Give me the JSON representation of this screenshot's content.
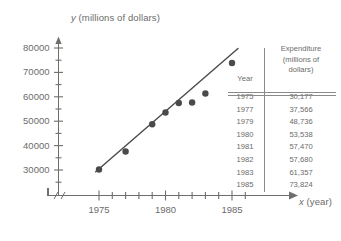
{
  "chart_data": {
    "type": "scatter",
    "title": "",
    "xlabel": "x (year)",
    "ylabel": "y (millions of dollars)",
    "x_axis_variable": "x",
    "x_axis_unit": "(year)",
    "y_axis_variable": "y",
    "y_axis_unit": "(millions of dollars)",
    "x": [
      1975,
      1977,
      1979,
      1980,
      1981,
      1982,
      1983,
      1985
    ],
    "values": [
      30177,
      37566,
      48736,
      53538,
      57470,
      57680,
      61357,
      73824
    ],
    "point_labels": [
      "30,177",
      "37,566",
      "48,736",
      "53,538",
      "57,470",
      "57,680",
      "61,357",
      "73,824"
    ],
    "xlim": [
      1974.2,
      1986.2
    ],
    "ylim": [
      27500,
      82000
    ],
    "x_tick_labels": [
      "1975",
      "1980",
      "1985"
    ],
    "x_major_ticks": [
      1975,
      1980,
      1985
    ],
    "x_minor_tick_step": 1,
    "y_tick_labels": [
      "30000",
      "40000",
      "50000",
      "60000",
      "70000",
      "80000"
    ],
    "y_major_ticks": [
      30000,
      40000,
      50000,
      60000,
      70000,
      80000
    ],
    "y_minor_tick_step": 5000,
    "grid": false,
    "legend": false,
    "has_axis_break": true,
    "axis_break_symbol": "//",
    "trendline": {
      "visible": true,
      "x_start": 1974.75,
      "y_start": 29300,
      "x_end": 1985.45,
      "y_end": 79800
    },
    "marker_color": "#4a4a4a",
    "line_color": "#4a4a4a",
    "axis_color": "#6e6e6e"
  },
  "table": {
    "header_year": "Year",
    "header_expenditure_line1": "Expenditure",
    "header_expenditure_line2": "(millions of",
    "header_expenditure_line3": "dollars)",
    "rows": [
      {
        "year": "1975",
        "expenditure": "30,177"
      },
      {
        "year": "1977",
        "expenditure": "37,566"
      },
      {
        "year": "1979",
        "expenditure": "48,736"
      },
      {
        "year": "1980",
        "expenditure": "53,538"
      },
      {
        "year": "1981",
        "expenditure": "57,470"
      },
      {
        "year": "1982",
        "expenditure": "57,680"
      },
      {
        "year": "1983",
        "expenditure": "61,357"
      },
      {
        "year": "1985",
        "expenditure": "73,824"
      }
    ]
  },
  "colors": {
    "ink": "#5a5a5a",
    "marker": "#4a4a4a",
    "rule": "#8a8a8a",
    "background": "#ffffff"
  }
}
